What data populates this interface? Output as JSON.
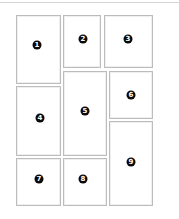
{
  "diagram": {
    "type": "page-layout-grid",
    "border_color": "#bcbcbc",
    "badge_color": "#0a0a0a",
    "panels": [
      {
        "label": "1",
        "x": 16,
        "y": 15,
        "w": 45,
        "h": 69,
        "badge_x": 37,
        "badge_y": 45
      },
      {
        "label": "2",
        "x": 63,
        "y": 15,
        "w": 38,
        "h": 53,
        "badge_x": 83,
        "badge_y": 39
      },
      {
        "label": "3",
        "x": 104,
        "y": 15,
        "w": 49,
        "h": 53,
        "badge_x": 128,
        "badge_y": 39
      },
      {
        "label": "4",
        "x": 16,
        "y": 86,
        "w": 45,
        "h": 70,
        "badge_x": 40,
        "badge_y": 118
      },
      {
        "label": "5",
        "x": 63,
        "y": 71,
        "w": 44,
        "h": 85,
        "badge_x": 85,
        "badge_y": 111
      },
      {
        "label": "6",
        "x": 109,
        "y": 71,
        "w": 44,
        "h": 48,
        "badge_x": 131,
        "badge_y": 95
      },
      {
        "label": "7",
        "x": 16,
        "y": 158,
        "w": 45,
        "h": 48,
        "badge_x": 39,
        "badge_y": 179
      },
      {
        "label": "8",
        "x": 63,
        "y": 158,
        "w": 44,
        "h": 48,
        "badge_x": 83,
        "badge_y": 179
      },
      {
        "label": "9",
        "x": 109,
        "y": 121,
        "w": 44,
        "h": 85,
        "badge_x": 131,
        "badge_y": 162
      }
    ]
  }
}
